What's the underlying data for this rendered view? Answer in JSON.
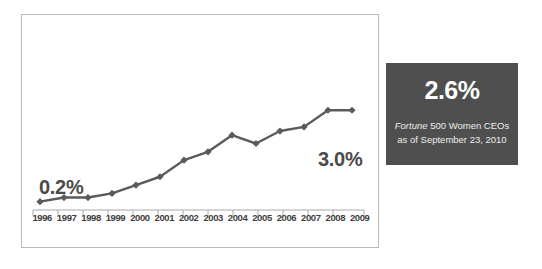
{
  "chart_data": {
    "type": "line",
    "title": "",
    "xlabel": "",
    "ylabel": "",
    "categories": [
      "1996",
      "1997",
      "1998",
      "1999",
      "2000",
      "2001",
      "2002",
      "2003",
      "2004",
      "2005",
      "2006",
      "2007",
      "2008",
      "2009"
    ],
    "values": [
      0.2,
      0.3,
      0.3,
      0.4,
      0.6,
      0.8,
      1.2,
      1.4,
      1.8,
      1.6,
      1.9,
      2.0,
      2.4,
      2.4
    ],
    "series": [
      {
        "name": "Fortune 500 Women CEOs",
        "values": [
          0.2,
          0.3,
          0.3,
          0.4,
          0.6,
          0.8,
          1.2,
          1.4,
          1.8,
          1.6,
          1.9,
          2.0,
          2.4,
          2.4
        ]
      }
    ],
    "ylim": [
      0,
      3.2
    ],
    "grid": false,
    "legend": "none",
    "marker": "diamond",
    "line_color": "#5a5a5a",
    "annotations": [
      {
        "text": "0.2%",
        "at": "1996",
        "position": "above-left"
      },
      {
        "text": "3.0%",
        "at": "2009",
        "position": "above-right"
      }
    ]
  },
  "chart": {
    "start_label": "0.2%",
    "end_label": "3.0%"
  },
  "stat_panel": {
    "value": "2.6%",
    "caption_source": "Fortune",
    "caption_rest": " 500 Women CEOs",
    "caption_line2": "as of September 23, 2010",
    "background_color": "#4f4f4f",
    "value_color": "#ffffff"
  }
}
